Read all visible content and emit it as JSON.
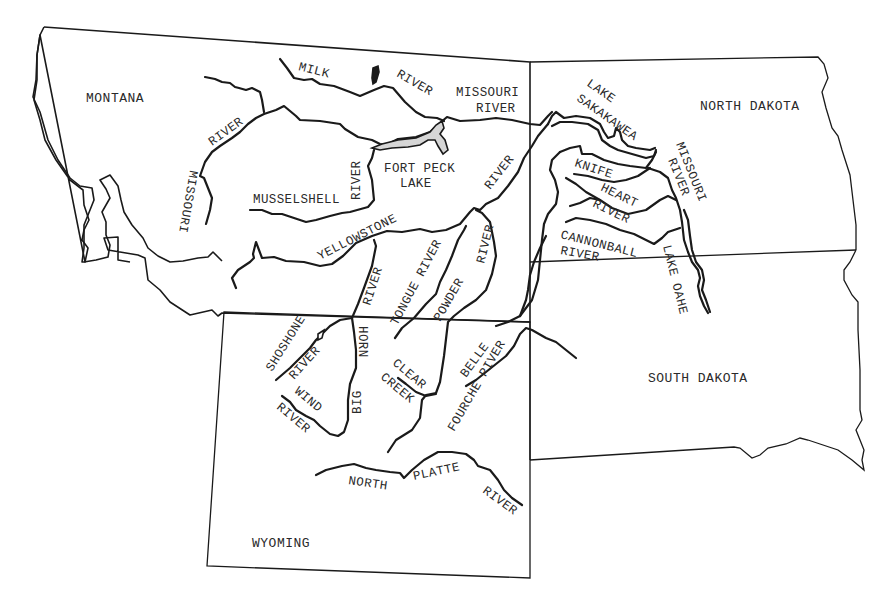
{
  "map": {
    "type": "river-map",
    "region": "Northern Great Plains",
    "colors": {
      "ink": "#1a1a1a",
      "background": "#ffffff",
      "lake_fill": "#d6d6d6"
    },
    "states": [
      {
        "id": "montana",
        "label": "MONTANA"
      },
      {
        "id": "north-dakota",
        "label": "NORTH DAKOTA"
      },
      {
        "id": "south-dakota",
        "label": "SOUTH DAKOTA"
      },
      {
        "id": "wyoming",
        "label": "WYOMING"
      }
    ],
    "labels": {
      "milk": "MILK",
      "milk_river": "RIVER",
      "missouri_mt_river": "RIVER",
      "missouri_mt": "MISSOURI",
      "missouri_river_top_1": "MISSOURI",
      "missouri_river_top_2": "RIVER",
      "musselshell": "MUSSELSHELL",
      "musselshell_river": "RIVER",
      "fort_peck_1": "FORT PECK",
      "fort_peck_2": "LAKE",
      "yellowstone": "YELLOWSTONE",
      "yellowstone_river": "RIVER",
      "lake_sakakawea_1": "LAKE",
      "lake_sakakawea_2": "SAKAKAWEA",
      "knife": "KNIFE",
      "heart": "HEART",
      "heart_river": "RIVER",
      "cannonball": "CANNONBALL",
      "cannonball_river": "RIVER",
      "missouri_nd_1": "MISSOURI",
      "missouri_nd_2": "RIVER",
      "lake_oahe": "LAKE OAHE",
      "tongue": "TONGUE RIVER",
      "powder": "POWDER",
      "powder_river": "RIVER",
      "bighorn_river": "RIVER",
      "bighorn_horn": "HORN",
      "bighorn_big": "BIG",
      "shoshone": "SHOSHONE",
      "shoshone_river": "RIVER",
      "wind": "WIND",
      "wind_river": "RIVER",
      "clear": "CLEAR",
      "creek": "CREEK",
      "belle": "BELLE",
      "fourche": "FOURCHE PIVER",
      "north": "NORTH",
      "platte": "PLATTE",
      "platte_river": "RIVER"
    },
    "rivers": [
      "Milk River",
      "Missouri River",
      "Musselshell River",
      "Yellowstone River",
      "Big Horn River",
      "Tongue River",
      "Powder River",
      "Shoshone River",
      "Wind River",
      "Clear Creek",
      "Belle Fourche River",
      "North Platte River",
      "Knife River",
      "Heart River",
      "Cannonball River"
    ],
    "lakes": [
      "Fort Peck Lake",
      "Lake Sakakawea",
      "Lake Oahe"
    ]
  }
}
